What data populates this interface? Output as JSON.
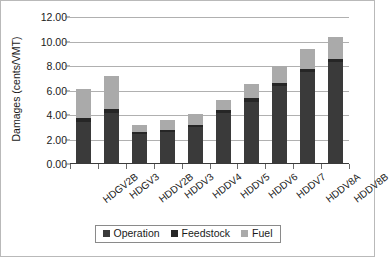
{
  "chart_data": {
    "type": "bar",
    "stacked": true,
    "title": "",
    "xlabel": "",
    "ylabel": "Damages (cents/VMT)",
    "ylim": [
      0,
      12
    ],
    "ytick_step": 2,
    "ytick_labels": [
      "0.00",
      "2.00",
      "4.00",
      "6.00",
      "8.00",
      "10.00",
      "12.00"
    ],
    "grid": true,
    "legend_position": "bottom",
    "categories": [
      "HDGV2B",
      "HDGV3",
      "HDDV2B",
      "HDDV3",
      "HDDV4",
      "HDDV5",
      "HDDV6",
      "HDDV7",
      "HDDV8A",
      "HDDV8B"
    ],
    "series": [
      {
        "name": "Operation",
        "color": "#3a3a3a",
        "values": [
          3.45,
          4.2,
          2.45,
          2.6,
          3.0,
          4.15,
          5.1,
          6.4,
          7.5,
          8.3
        ]
      },
      {
        "name": "Feedstock",
        "color": "#262626",
        "values": [
          0.3,
          0.3,
          0.15,
          0.2,
          0.2,
          0.25,
          0.25,
          0.25,
          0.25,
          0.3
        ]
      },
      {
        "name": "Fuel",
        "color": "#aaaaaa",
        "values": [
          2.35,
          2.7,
          0.6,
          0.8,
          0.9,
          0.8,
          1.15,
          1.35,
          1.65,
          1.8
        ]
      }
    ],
    "totals": [
      6.1,
      7.2,
      3.2,
      3.6,
      4.1,
      5.2,
      6.5,
      8.0,
      9.4,
      10.4
    ]
  },
  "legend": {
    "items": [
      {
        "label": "Operation",
        "color": "#3a3a3a"
      },
      {
        "label": "Feedstock",
        "color": "#262626"
      },
      {
        "label": "Fuel",
        "color": "#aaaaaa"
      }
    ]
  }
}
